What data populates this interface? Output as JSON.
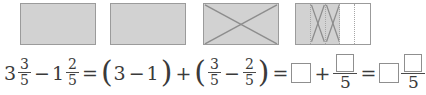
{
  "problem": {
    "type": "fraction-subtraction-area-model",
    "models": {
      "caption": "",
      "rectangles": [
        {
          "id": "whole-1",
          "label": "whole",
          "fill": "shaded",
          "crossed_out": false,
          "partitions": 1
        },
        {
          "id": "whole-2",
          "label": "whole",
          "fill": "shaded",
          "crossed_out": false,
          "partitions": 1
        },
        {
          "id": "whole-3",
          "label": "whole crossed out",
          "fill": "shaded",
          "crossed_out": true,
          "partitions": 1
        },
        {
          "id": "fifths",
          "label": "three fifths shaded, two crossed out",
          "fill": "partial",
          "crossed_out": false,
          "partitions": 5,
          "shaded_parts": 3,
          "crossed_parts": 2
        }
      ]
    },
    "equation": {
      "mixed_1": {
        "whole": "3",
        "numerator": "3",
        "denominator": "5"
      },
      "minus": "−",
      "mixed_2": {
        "whole": "1",
        "numerator": "2",
        "denominator": "5"
      },
      "equals_1": "=",
      "group_wholes": {
        "open": "(",
        "left": "3",
        "op": "−",
        "right": "1",
        "close": ")"
      },
      "plus_1": "+",
      "group_fractions": {
        "open": "(",
        "left": {
          "numerator": "3",
          "denominator": "5"
        },
        "op": "−",
        "right": {
          "numerator": "2",
          "denominator": "5"
        },
        "close": ")"
      },
      "equals_2": "=",
      "answer_whole_box": "",
      "plus_2": "+",
      "answer_fraction_box": {
        "numerator": "",
        "denominator": "5"
      },
      "equals_3": "=",
      "final_whole_box": "",
      "final_fraction_box": {
        "numerator": "",
        "denominator": "5"
      }
    }
  },
  "colors": {
    "shade_fill": "#d2d2d2",
    "rect_border": "#9b9b9b",
    "cross_line": "#8d8d8d",
    "partition_dotted": "#a6a6a6",
    "text": "#3a3a3a",
    "answer_box_border": "#8f8f8f",
    "page_background": "#ffffff"
  }
}
